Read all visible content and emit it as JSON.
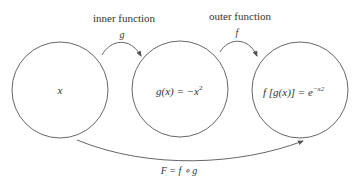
{
  "diagram": {
    "type": "function-composition",
    "nodes": [
      {
        "id": "domain",
        "label": "x"
      },
      {
        "id": "inner",
        "label_main": "g(x) = −x",
        "label_sup": "2"
      },
      {
        "id": "outer",
        "label_main": "f [g(x)] = e",
        "label_sup": "−x2"
      }
    ],
    "edges": [
      {
        "from": "domain",
        "to": "inner",
        "title": "inner function",
        "symbol": "g"
      },
      {
        "from": "inner",
        "to": "outer",
        "title": "outer function",
        "symbol": "f"
      },
      {
        "from": "domain",
        "to": "outer",
        "symbol": "F = f ∘ g"
      }
    ],
    "colors": {
      "stroke": "#555555",
      "text": "#333333",
      "background": "#ffffff"
    }
  }
}
